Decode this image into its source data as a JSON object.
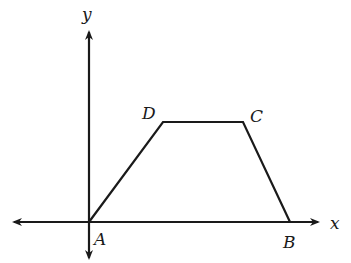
{
  "diagram": {
    "type": "coordinate-geometry",
    "axes": {
      "x_label": "x",
      "y_label": "y"
    },
    "points": [
      {
        "name": "A",
        "label": "A"
      },
      {
        "name": "B",
        "label": "B"
      },
      {
        "name": "C",
        "label": "C"
      },
      {
        "name": "D",
        "label": "D"
      }
    ],
    "segments": [
      "AD",
      "DC",
      "CB"
    ],
    "colors": {
      "stroke": "#1a1a1a",
      "background": "#ffffff"
    }
  }
}
